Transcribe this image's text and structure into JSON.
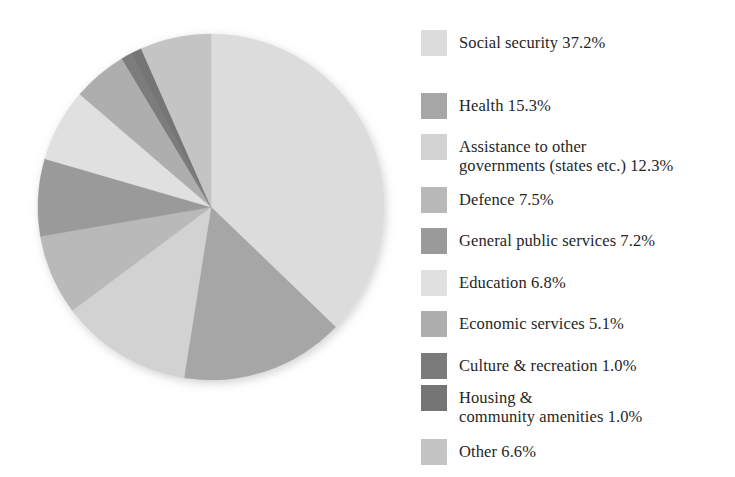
{
  "chart_data": {
    "type": "pie",
    "title": "",
    "subtitle": "",
    "xlabel": "",
    "ylabel": "",
    "units": "percent",
    "start_angle_deg": 0,
    "direction": "clockwise",
    "legend_position": "right",
    "grid": false,
    "categories": [
      "Social security",
      "Health",
      "Assistance to other governments (states etc.)",
      "Defence",
      "General public services",
      "Education",
      "Economic services",
      "Culture & recreation",
      "Housing & community amenities",
      "Other"
    ],
    "values": [
      37.2,
      15.3,
      12.3,
      7.5,
      7.2,
      6.8,
      5.1,
      1.0,
      1.0,
      6.6
    ],
    "colors": [
      "#dcdcdc",
      "#a6a6a6",
      "#d2d2d2",
      "#b9b9b9",
      "#9a9a9a",
      "#e0e0e0",
      "#aeaeae",
      "#7b7b7b",
      "#757575",
      "#c4c4c4"
    ]
  },
  "legend": {
    "items": [
      {
        "label": "Social security 37.2%",
        "color": "#dcdcdc"
      },
      {
        "label": "Health 15.3%",
        "color": "#a6a6a6"
      },
      {
        "label": "Assistance to other\ngovernments (states etc.) 12.3%",
        "color": "#d2d2d2"
      },
      {
        "label": "Defence 7.5%",
        "color": "#b9b9b9"
      },
      {
        "label": "General public services 7.2%",
        "color": "#9a9a9a"
      },
      {
        "label": "Education 6.8%",
        "color": "#e0e0e0"
      },
      {
        "label": "Economic services 5.1%",
        "color": "#aeaeae"
      },
      {
        "label": "Culture & recreation 1.0%",
        "color": "#7b7b7b"
      },
      {
        "label": "Housing &\ncommunity amenities 1.0%",
        "color": "#757575"
      },
      {
        "label": "Other 6.6%",
        "color": "#c4c4c4"
      }
    ]
  }
}
